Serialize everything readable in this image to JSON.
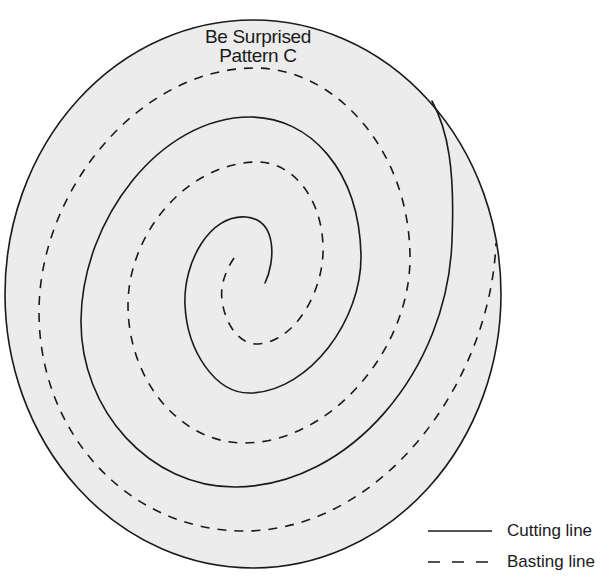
{
  "title": {
    "line1": "Be Surprised",
    "line2": "Pattern C"
  },
  "pattern": {
    "shape": "ellipse",
    "fill_color": "#ececec",
    "stroke_color": "#1a1a1a",
    "lines": [
      {
        "type": "cutting",
        "style": "solid",
        "description": "spiral cutting line from center outward to outer edge"
      },
      {
        "type": "basting",
        "style": "dashed",
        "description": "spiral basting line interleaved between cutting line turns"
      }
    ]
  },
  "legend": {
    "items": [
      {
        "style": "solid",
        "label": "Cutting line"
      },
      {
        "style": "dashed",
        "label": "Basting line"
      }
    ]
  }
}
